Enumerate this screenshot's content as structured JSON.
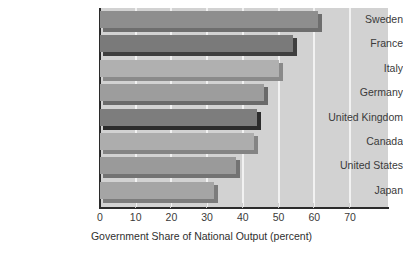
{
  "chart_data": {
    "type": "bar",
    "orientation": "horizontal",
    "title": "",
    "subtitle": "",
    "xlabel": "Government Share of National Output (percent)",
    "ylabel": "",
    "categories": [
      "Sweden",
      "France",
      "Italy",
      "Germany",
      "United Kingdom",
      "Canada",
      "United States",
      "Japan"
    ],
    "values": [
      61,
      54,
      50,
      46,
      44,
      43,
      38,
      32
    ],
    "xlim": [
      0,
      80
    ],
    "xticks": [
      0,
      10,
      20,
      30,
      40,
      50,
      60,
      70
    ],
    "xtick_labels": [
      "0",
      "10",
      "20",
      "30",
      "40",
      "50",
      "60",
      "70"
    ],
    "grid": true,
    "grid_axis": "x",
    "legend": false,
    "legend_position": "none",
    "plot_background": "#d2d2d2",
    "gridline_color": "#f2f2f2",
    "axis_color": "#2b2b2b",
    "bars": [
      {
        "label": "Sweden",
        "value": 61,
        "fill": "#8e8e8e",
        "shadow": "#6e6e6e"
      },
      {
        "label": "France",
        "value": 54,
        "fill": "#7a7a7a",
        "shadow": "#3f3f3f"
      },
      {
        "label": "Italy",
        "value": 50,
        "fill": "#b0b0b0",
        "shadow": "#8a8a8a"
      },
      {
        "label": "Germany",
        "value": 46,
        "fill": "#9d9d9d",
        "shadow": "#6a6a6a"
      },
      {
        "label": "United Kingdom",
        "value": 44,
        "fill": "#7d7d7d",
        "shadow": "#2c2c2c"
      },
      {
        "label": "Canada",
        "value": 43,
        "fill": "#adadad",
        "shadow": "#848484"
      },
      {
        "label": "United States",
        "value": 38,
        "fill": "#9a9a9a",
        "shadow": "#737373"
      },
      {
        "label": "Japan",
        "value": 32,
        "fill": "#a5a5a5",
        "shadow": "#7c7c7c"
      }
    ]
  },
  "axis": {
    "x_title": "Government Share of National Output (percent)"
  }
}
